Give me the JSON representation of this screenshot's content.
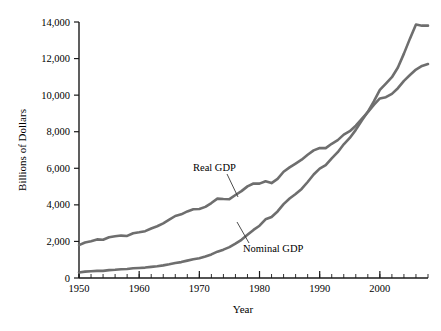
{
  "chart_data": {
    "type": "line",
    "title": "",
    "xlabel": "Year",
    "ylabel": "Billions of Dollars",
    "xlim": [
      1950,
      2008
    ],
    "ylim": [
      0,
      14000
    ],
    "grid": false,
    "legend_position": "inline-annotation",
    "x_ticks": [
      1950,
      1960,
      1970,
      1980,
      1990,
      2000
    ],
    "x_tick_labels": [
      "1950",
      "1960",
      "1970",
      "1980",
      "1990",
      "2000"
    ],
    "x_minor_tick_step": 2,
    "y_ticks": [
      0,
      2000,
      4000,
      6000,
      8000,
      10000,
      12000,
      14000
    ],
    "y_tick_labels": [
      "0",
      "2,000",
      "4,000",
      "6,000",
      "8,000",
      "10,000",
      "12,000",
      "14,000"
    ],
    "x": [
      1950,
      1951,
      1952,
      1953,
      1954,
      1955,
      1956,
      1957,
      1958,
      1959,
      1960,
      1961,
      1962,
      1963,
      1964,
      1965,
      1966,
      1967,
      1968,
      1969,
      1970,
      1971,
      1972,
      1973,
      1974,
      1975,
      1976,
      1977,
      1978,
      1979,
      1980,
      1981,
      1982,
      1983,
      1984,
      1985,
      1986,
      1987,
      1988,
      1989,
      1990,
      1991,
      1992,
      1993,
      1994,
      1995,
      1996,
      1997,
      1998,
      1999,
      2000,
      2001,
      2002,
      2003,
      2004,
      2005,
      2006,
      2007,
      2008
    ],
    "series": [
      {
        "name": "Real GDP",
        "color": "#6e6e6e",
        "label_text": "Real GDP",
        "values": [
          1800,
          1940,
          2010,
          2110,
          2090,
          2230,
          2280,
          2320,
          2300,
          2450,
          2500,
          2560,
          2710,
          2830,
          2990,
          3190,
          3390,
          3480,
          3640,
          3760,
          3770,
          3890,
          4100,
          4340,
          4320,
          4310,
          4540,
          4750,
          5010,
          5170,
          5160,
          5290,
          5190,
          5420,
          5810,
          6050,
          6260,
          6470,
          6740,
          6980,
          7110,
          7100,
          7340,
          7540,
          7840,
          8030,
          8330,
          8700,
          9070,
          9470,
          9820,
          9890,
          10070,
          10380,
          10780,
          11100,
          11400,
          11600,
          11700
        ]
      },
      {
        "name": "Nominal GDP",
        "color": "#6e6e6e",
        "label_text": "Nominal GDP",
        "values": [
          300,
          350,
          370,
          390,
          390,
          430,
          450,
          480,
          490,
          530,
          550,
          570,
          610,
          640,
          690,
          750,
          820,
          870,
          950,
          1030,
          1080,
          1180,
          1290,
          1440,
          1550,
          1690,
          1880,
          2090,
          2360,
          2630,
          2860,
          3210,
          3340,
          3640,
          4040,
          4350,
          4590,
          4870,
          5250,
          5660,
          5980,
          6170,
          6540,
          6880,
          7310,
          7660,
          8100,
          8610,
          9090,
          9660,
          10290,
          10630,
          10980,
          11510,
          12270,
          13090,
          13860,
          13800,
          13800
        ]
      }
    ],
    "annotations": [
      {
        "text": "Real GDP",
        "series": "Real GDP",
        "label_x": 193,
        "label_y": 171,
        "leader_to_x": 238,
        "leader_to_y": 197
      },
      {
        "text": "Nominal GDP",
        "series": "Nominal GDP",
        "label_x": 243,
        "label_y": 252,
        "leader_to_x": 237,
        "leader_to_y": 222
      }
    ]
  },
  "colors": {
    "background": "#ffffff",
    "axis": "#1a1a1a",
    "text": "#000000",
    "series_gray": "#6e6e6e",
    "leader": "#3a3a3a"
  }
}
